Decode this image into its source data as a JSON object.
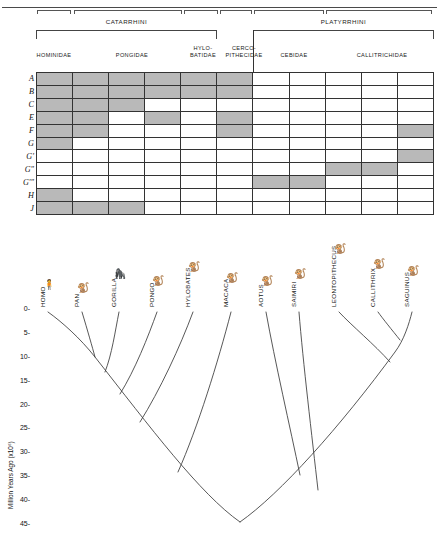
{
  "figure": {
    "top_rule": true
  },
  "matrix": {
    "superfamilies": [
      {
        "name": "CATARRHINI",
        "start_col": 1,
        "end_col": 6
      },
      {
        "name": "PLATYRRHINI",
        "start_col": 7,
        "end_col": 11
      }
    ],
    "families": [
      {
        "name": "HOMINIDAE",
        "start_col": 1,
        "end_col": 1
      },
      {
        "name": "PONGIDAE",
        "start_col": 2,
        "end_col": 4
      },
      {
        "name": "HYLO-\nBATIDAE",
        "start_col": 5,
        "end_col": 5
      },
      {
        "name": "CERCO-\nPITHECIDAE",
        "start_col": 6,
        "end_col": 6
      },
      {
        "name": "CEBIDAE",
        "start_col": 7,
        "end_col": 8
      },
      {
        "name": "CALLITRICHIDAE",
        "start_col": 9,
        "end_col": 11
      }
    ],
    "column_count": 11,
    "row_labels": [
      "A",
      "B",
      "C",
      "E",
      "F",
      "G",
      "G'",
      "G\"",
      "G'\"",
      "H",
      "J"
    ],
    "shaded_color": "#b9b9b9",
    "cells": [
      [
        1,
        1,
        1,
        1,
        1,
        1,
        0,
        0,
        0,
        0,
        0
      ],
      [
        1,
        1,
        1,
        1,
        1,
        1,
        0,
        0,
        0,
        0,
        0
      ],
      [
        1,
        1,
        1,
        0,
        0,
        0,
        0,
        0,
        0,
        0,
        0
      ],
      [
        1,
        1,
        0,
        1,
        0,
        1,
        0,
        0,
        0,
        0,
        0
      ],
      [
        1,
        1,
        0,
        0,
        0,
        1,
        0,
        0,
        0,
        0,
        1
      ],
      [
        1,
        0,
        0,
        0,
        0,
        0,
        0,
        0,
        0,
        0,
        0
      ],
      [
        0,
        0,
        0,
        0,
        0,
        0,
        0,
        0,
        0,
        0,
        1
      ],
      [
        0,
        0,
        0,
        0,
        0,
        0,
        0,
        0,
        1,
        1,
        0
      ],
      [
        0,
        0,
        0,
        0,
        0,
        0,
        1,
        1,
        0,
        0,
        0
      ],
      [
        1,
        0,
        0,
        0,
        0,
        0,
        0,
        0,
        0,
        0,
        0
      ],
      [
        1,
        1,
        1,
        0,
        0,
        0,
        0,
        0,
        0,
        0,
        0
      ]
    ]
  },
  "chart_data": {
    "type": "line",
    "title": "",
    "xlabel": "",
    "ylabel": "Million Years Ago (x10⁶)",
    "ylim": [
      0,
      47
    ],
    "yticks": [
      0,
      5,
      10,
      15,
      20,
      25,
      30,
      35,
      40,
      45
    ],
    "ytick_labels": [
      "0-",
      "5-",
      "10-",
      "15-",
      "20-",
      "25-",
      "30-",
      "35-",
      "40-",
      "45-"
    ],
    "grid": false,
    "legend": "none",
    "taxa": [
      {
        "name": "HOMO",
        "tip_x": 48,
        "glyph": "🧍"
      },
      {
        "name": "PAN",
        "tip_x": 82,
        "glyph": "🐒"
      },
      {
        "name": "GORILLA",
        "tip_x": 119,
        "glyph": "🦍"
      },
      {
        "name": "PONGO",
        "tip_x": 157,
        "glyph": "🐒"
      },
      {
        "name": "HYLOBATES",
        "tip_x": 193,
        "glyph": "🐒"
      },
      {
        "name": "MACACA",
        "tip_x": 231,
        "glyph": "🐒"
      },
      {
        "name": "AOTUS",
        "tip_x": 266,
        "glyph": "🐒"
      },
      {
        "name": "SAIMIRI",
        "tip_x": 299,
        "glyph": "🐒"
      },
      {
        "name": "LEONTOPITHECUS",
        "tip_x": 339,
        "glyph": "🐒"
      },
      {
        "name": "CALLITHRIX",
        "tip_x": 378,
        "glyph": "🐒"
      },
      {
        "name": "SAGUINUS",
        "tip_x": 412,
        "glyph": "🐒"
      }
    ],
    "divergence_nodes": [
      {
        "clade": "HOMO-PAN",
        "mya": 7
      },
      {
        "clade": "(HOMO,PAN)-GORILLA",
        "mya": 10
      },
      {
        "clade": "African apes - PONGO",
        "mya": 15
      },
      {
        "clade": "Great apes - HYLOBATES",
        "mya": 20
      },
      {
        "clade": "Hominoidea - MACACA",
        "mya": 30
      },
      {
        "clade": "Catarrhini - Platyrrhini",
        "mya": 45
      },
      {
        "clade": "AOTUS/SAIMIRI split",
        "mya": 20
      },
      {
        "clade": "CALLITHRIX-SAGUINUS",
        "mya": 7
      },
      {
        "clade": "(CALLITHRIX,SAGUINUS)-LEONTOPITHECUS",
        "mya": 12
      },
      {
        "clade": "Callitrichidae - Cebidae",
        "mya": 30
      }
    ]
  }
}
